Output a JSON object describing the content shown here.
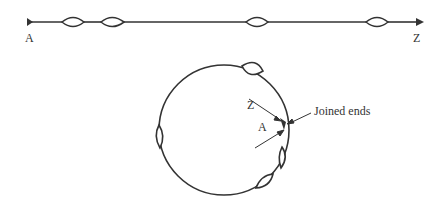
{
  "diagram": {
    "type": "linear-to-circular-molecule",
    "linear": {
      "start_label": "A",
      "end_label": "Z",
      "bubbles": 4
    },
    "circular": {
      "labels": {
        "z": "Z",
        "a": "A",
        "joined": "Joined ends"
      },
      "bubbles": 4
    },
    "colors": {
      "stroke": "#333333",
      "background": "#ffffff"
    }
  }
}
